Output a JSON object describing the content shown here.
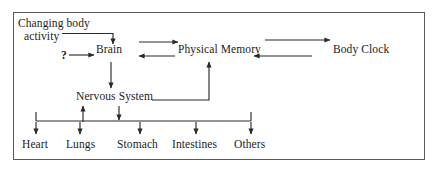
{
  "diagram": {
    "frame": {
      "border_color": "#5a5a5a",
      "background": "#ffffff"
    },
    "line_color": "#2a2a2a",
    "nodes": [
      {
        "id": "changing-body-activity",
        "label_line1": "Changing body",
        "label_line2": "activity",
        "x": 18,
        "y": 17
      },
      {
        "id": "question-mark",
        "label": "?",
        "x": 61,
        "y": 51
      },
      {
        "id": "brain",
        "label": "Brain",
        "x": 99,
        "y": 51
      },
      {
        "id": "physical-memory",
        "label": "Physical Memory",
        "x": 176,
        "y": 51
      },
      {
        "id": "body-clock",
        "label": "Body Clock",
        "x": 317,
        "y": 51
      },
      {
        "id": "nervous-system",
        "label": "Nervous System",
        "x": 78,
        "y": 95
      },
      {
        "id": "heart",
        "label": "Heart",
        "x": 25,
        "y": 141
      },
      {
        "id": "lungs",
        "label": "Lungs",
        "x": 68,
        "y": 141
      },
      {
        "id": "stomach",
        "label": "Stomach",
        "x": 118,
        "y": 141
      },
      {
        "id": "intestines",
        "label": "Intestines",
        "x": 176,
        "y": 141
      },
      {
        "id": "others",
        "label": "Others",
        "x": 238,
        "y": 141
      }
    ],
    "connections": [
      {
        "from": "changing-body-activity",
        "to": "brain",
        "style": "elbow-down"
      },
      {
        "from": "question-mark",
        "to": "brain",
        "style": "straight-right"
      },
      {
        "from": "brain",
        "to": "physical-memory",
        "style": "straight-right"
      },
      {
        "from": "physical-memory",
        "to": "brain",
        "style": "straight-left"
      },
      {
        "from": "physical-memory",
        "to": "body-clock",
        "style": "straight-right"
      },
      {
        "from": "body-clock",
        "to": "physical-memory",
        "style": "straight-left"
      },
      {
        "from": "brain",
        "to": "nervous-system",
        "style": "straight-down"
      },
      {
        "from": "nervous-system",
        "to": "physical-memory",
        "style": "elbow-up"
      },
      {
        "from": "nervous-system",
        "to": "organ-bus",
        "style": "straight-down"
      },
      {
        "from": "organ-bus",
        "to": "nervous-system",
        "style": "straight-up"
      },
      {
        "from": "organ-bus",
        "to": "heart",
        "style": "straight-down"
      },
      {
        "from": "organ-bus",
        "to": "lungs",
        "style": "straight-down"
      },
      {
        "from": "organ-bus",
        "to": "stomach",
        "style": "straight-down"
      },
      {
        "from": "organ-bus",
        "to": "intestines",
        "style": "straight-down"
      },
      {
        "from": "organ-bus",
        "to": "others",
        "style": "straight-down"
      }
    ]
  }
}
